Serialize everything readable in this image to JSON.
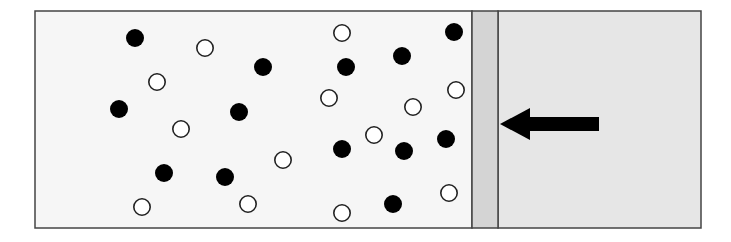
{
  "diagram": {
    "colors": {
      "gas_chamber": "#f6f6f6",
      "piston": "#d4d4d4",
      "right_region": "#e6e6e6",
      "stroke": "#444444",
      "filled_particle": "#000000",
      "open_particle": "#ffffff"
    },
    "container": {
      "x": 35,
      "y": 11,
      "width": 666,
      "height": 217
    },
    "piston": {
      "x": 472,
      "width": 26
    },
    "arrow": {
      "direction": "left",
      "x_start": 599,
      "x_end": 500,
      "y": 124
    },
    "particles": {
      "filled": [
        [
          135,
          38
        ],
        [
          263,
          67
        ],
        [
          346,
          67
        ],
        [
          402,
          56
        ],
        [
          454,
          32
        ],
        [
          119,
          109
        ],
        [
          239,
          112
        ],
        [
          342,
          149
        ],
        [
          404,
          151
        ],
        [
          446,
          139
        ],
        [
          164,
          173
        ],
        [
          225,
          177
        ],
        [
          393,
          204
        ]
      ],
      "open": [
        [
          205,
          48
        ],
        [
          342,
          33
        ],
        [
          157,
          82
        ],
        [
          329,
          98
        ],
        [
          413,
          107
        ],
        [
          456,
          90
        ],
        [
          181,
          129
        ],
        [
          374,
          135
        ],
        [
          283,
          160
        ],
        [
          449,
          193
        ],
        [
          142,
          207
        ],
        [
          248,
          204
        ],
        [
          342,
          213
        ]
      ]
    },
    "particle_radius": 9
  }
}
